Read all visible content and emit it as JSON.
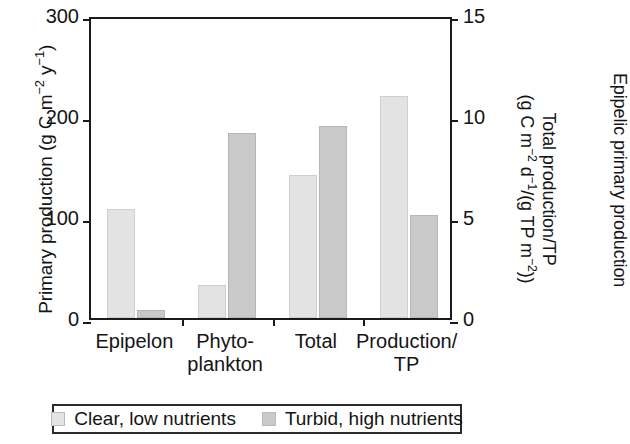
{
  "chart_data": {
    "type": "bar",
    "title": "",
    "categories": [
      "Epipelon",
      "Phyto-plankton",
      "Total",
      "Production/TP"
    ],
    "category_lines": [
      [
        "Epipelon"
      ],
      [
        "Phyto-",
        "plankton"
      ],
      [
        "Total"
      ],
      [
        "Production/",
        "TP"
      ]
    ],
    "series": [
      {
        "name": "Clear, low nutrients",
        "color": "#e3e3e3",
        "values": [
          108,
          33,
          142,
          220
        ]
      },
      {
        "name": "Turbid, high nutrients",
        "color": "#c9c9c9",
        "values": [
          8,
          183,
          190,
          102
        ]
      }
    ],
    "axis_assignment": [
      "left",
      "left",
      "left",
      "right"
    ],
    "left_axis": {
      "label": "Primary production (g C m⁻² y⁻¹)",
      "label_plain": "Primary production (g C m-2 y-1)",
      "ticks": [
        "0",
        "100",
        "200",
        "300"
      ],
      "tick_values": [
        0,
        100,
        200,
        300
      ],
      "ylim": [
        0,
        300
      ]
    },
    "right_axis": {
      "label_line1": "Total production/TP",
      "label_line2": "(g C m⁻² d⁻¹/(g TP m⁻²))",
      "label_plain": "Total production/TP (g C m-2 d-1/(g TP m-2))",
      "ticks": [
        "0",
        "5",
        "10",
        "15"
      ],
      "tick_values": [
        0,
        5,
        10,
        15
      ],
      "ylim": [
        0,
        15
      ]
    },
    "secondary_label": "Epipelic primary production",
    "grid": false,
    "legend_position": "bottom",
    "legend": [
      "Clear, low nutrients",
      "Turbid, high nutrients"
    ]
  },
  "legend": {
    "entries": [
      {
        "label": "Clear, low nutrients"
      },
      {
        "label": "Turbid, high nutrients"
      }
    ]
  }
}
